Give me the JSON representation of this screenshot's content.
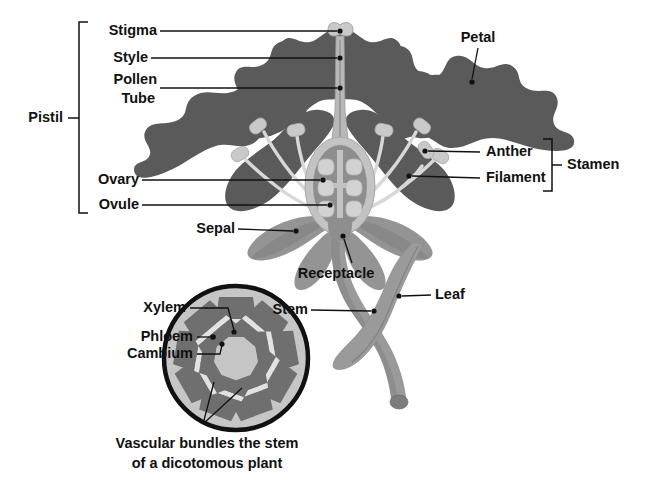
{
  "figure": {
    "caption_line1": "Vascular bundles the stem",
    "caption_line2": "of a dicotomous plant"
  },
  "colors": {
    "background": "#ffffff",
    "petal": "#5a5a5a",
    "petal_shadow": "#4e4e4e",
    "sepal": "#949494",
    "sepal_shade": "#7e7e7e",
    "stem": "#9a9a9a",
    "stem_shade": "#868686",
    "filament": "#d8d8d8",
    "anther": "#c9c9c9",
    "style": "#b8b8b8",
    "ovary_wall": "#c3c3c3",
    "ovary_inner": "#8e8e8e",
    "ovule": "#d2d2d2",
    "cross_section_fill": "#c6c6c6",
    "cross_section_outline": "#111111",
    "bundle_dark": "#6f6f6f",
    "text": "#111111"
  },
  "brackets": [
    {
      "name": "pistil",
      "label": "Pistil",
      "side": "left"
    },
    {
      "name": "stamen",
      "label": "Stamen",
      "side": "right"
    }
  ],
  "labels": {
    "stigma": "Stigma",
    "style": "Style",
    "pollen": "Pollen",
    "tube": "Tube",
    "pistil": "Pistil",
    "ovary": "Ovary",
    "ovule": "Ovule",
    "sepal": "Sepal",
    "receptacle": "Receptacle",
    "petal": "Petal",
    "anther": "Anther",
    "filament": "Filament",
    "stamen": "Stamen",
    "leaf": "Leaf",
    "stem": "Stem",
    "xylem": "Xylem",
    "phloem": "Phloem",
    "cambium": "Cambium"
  },
  "parts": [
    {
      "name": "stigma",
      "label": "Stigma",
      "label_xy": [
        116,
        31
      ],
      "target_xy": [
        341,
        31
      ],
      "side": "left",
      "group": "pistil"
    },
    {
      "name": "style",
      "label": "Style",
      "label_xy": [
        116,
        58
      ],
      "target_xy": [
        341,
        58
      ],
      "side": "left",
      "group": "pistil"
    },
    {
      "name": "pollen-tube",
      "label": "Pollen Tube",
      "label_xy": [
        116,
        80
      ],
      "target_xy": [
        341,
        88
      ],
      "side": "left",
      "group": "pistil"
    },
    {
      "name": "ovary",
      "label": "Ovary",
      "label_xy": [
        136,
        180
      ],
      "target_xy": [
        323,
        180
      ],
      "side": "left",
      "group": "pistil"
    },
    {
      "name": "ovule",
      "label": "Ovule",
      "label_xy": [
        136,
        205
      ],
      "target_xy": [
        330,
        205
      ],
      "side": "left",
      "group": "pistil"
    },
    {
      "name": "sepal",
      "label": "Sepal",
      "label_xy": [
        231,
        229
      ],
      "target_xy": [
        296,
        232
      ],
      "side": "left",
      "group": "flower"
    },
    {
      "name": "receptacle",
      "label": "Receptacle",
      "label_xy": [
        336,
        274
      ],
      "target_xy": [
        345,
        236
      ],
      "side": "below",
      "group": "flower"
    },
    {
      "name": "petal",
      "label": "Petal",
      "label_xy": [
        478,
        38
      ],
      "target_xy": [
        472,
        82
      ],
      "side": "above",
      "group": "flower"
    },
    {
      "name": "anther",
      "label": "Anther",
      "label_xy": [
        487,
        152
      ],
      "target_xy": [
        425,
        150
      ],
      "side": "right",
      "group": "stamen"
    },
    {
      "name": "filament",
      "label": "Filament",
      "label_xy": [
        487,
        178
      ],
      "target_xy": [
        409,
        176
      ],
      "side": "right",
      "group": "stamen"
    },
    {
      "name": "leaf",
      "label": "Leaf",
      "label_xy": [
        438,
        295
      ],
      "target_xy": [
        399,
        296
      ],
      "side": "right",
      "group": "plant"
    },
    {
      "name": "stem",
      "label": "Stem",
      "label_xy": [
        304,
        310
      ],
      "target_xy": [
        374,
        311
      ],
      "side": "right",
      "group": "plant"
    },
    {
      "name": "xylem",
      "label": "Xylem",
      "label_xy": [
        152,
        308
      ],
      "target_xy": [
        229,
        330
      ],
      "side": "left",
      "group": "cross-section"
    },
    {
      "name": "phloem",
      "label": "Phloem",
      "label_xy": [
        152,
        337
      ],
      "target_xy": [
        213,
        337
      ],
      "side": "left",
      "group": "cross-section"
    },
    {
      "name": "cambium",
      "label": "Cambium",
      "label_xy": [
        152,
        354
      ],
      "target_xy": [
        222,
        344
      ],
      "side": "left",
      "group": "cross-section"
    }
  ],
  "cross_section": {
    "center": [
      236,
      358
    ],
    "radius": 72,
    "bundle_count": 9,
    "caption": "Vascular bundles the stem of a dicotomous plant"
  },
  "ovary": {
    "ovule_rows": 3,
    "ovule_cols": 2,
    "ovule_count": 6
  }
}
